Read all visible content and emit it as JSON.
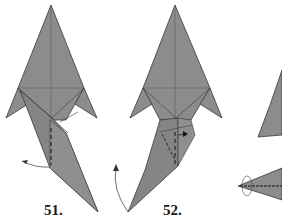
{
  "diagram": {
    "type": "origami-instructions",
    "steps": [
      {
        "number": "51.",
        "description": "swivel fold, flap moves left (arrow)"
      },
      {
        "number": "52.",
        "description": "fold flap, dashed valley line, arrow"
      },
      {
        "number": "53",
        "description": "partially visible result, rotated view"
      }
    ],
    "colors": {
      "paper": "#8a8a8a",
      "paper_light": "#9a9a9a",
      "line": "#3a3a3a",
      "background": "#ffffff"
    }
  }
}
